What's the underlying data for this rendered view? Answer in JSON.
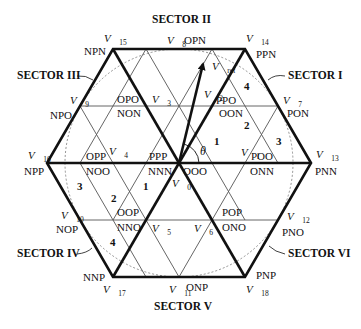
{
  "sectors": {
    "I": "SECTOR I",
    "II": "SECTOR II",
    "III": "SECTOR III",
    "IV": "SECTOR IV",
    "V": "SECTOR V",
    "VI": "SECTOR VI"
  },
  "vectors": {
    "v0": {
      "name": "V",
      "sub": "0"
    },
    "v1": {
      "name": "V",
      "sub": "1"
    },
    "v2": {
      "name": "V",
      "sub": "2"
    },
    "v3": {
      "name": "V",
      "sub": "3"
    },
    "v4": {
      "name": "V",
      "sub": "4"
    },
    "v5": {
      "name": "V",
      "sub": "5"
    },
    "v6": {
      "name": "V",
      "sub": "6"
    },
    "v7": {
      "name": "V",
      "sub": "7"
    },
    "v8": {
      "name": "V",
      "sub": "8"
    },
    "v9": {
      "name": "V",
      "sub": "9"
    },
    "v10": {
      "name": "V",
      "sub": "10"
    },
    "v11": {
      "name": "V",
      "sub": "11"
    },
    "v12": {
      "name": "V",
      "sub": "12"
    },
    "v13": {
      "name": "V",
      "sub": "13"
    },
    "v14": {
      "name": "V",
      "sub": "14"
    },
    "v15": {
      "name": "V",
      "sub": "15"
    },
    "v16": {
      "name": "V",
      "sub": "16"
    },
    "v17": {
      "name": "V",
      "sub": "17"
    },
    "v18": {
      "name": "V",
      "sub": "18"
    },
    "vref": {
      "name": "V",
      "sub": "ref"
    }
  },
  "states": {
    "v0_upper": "PPP",
    "v0_mid": "NNN",
    "v0_lower": "OOO",
    "v1_upper": "POO",
    "v1_lower": "ONN",
    "v2_upper": "PPO",
    "v2_lower": "OON",
    "v3_upper": "OPO",
    "v3_lower": "NON",
    "v4_upper": "OPP",
    "v4_lower": "NOO",
    "v5_upper": "OOP",
    "v5_lower": "NNO",
    "v6_upper": "POP",
    "v6_lower": "ONO",
    "v7": "PON",
    "v8": "OPN",
    "v9": "NPO",
    "v10": "NOP",
    "v11": "ONP",
    "v12": "PNO",
    "v13": "PNN",
    "v14": "PPN",
    "v15": "NPN",
    "v16": "NPP",
    "v17": "NNP",
    "v18": "PNP"
  },
  "regions": {
    "s1_r1": "1",
    "s1_r2": "2",
    "s1_r3": "3",
    "s1_r4": "4",
    "s3_r1": "1",
    "s3_r2": "2",
    "s3_r3": "3",
    "s4_r4": "4"
  },
  "angle_label": "θ",
  "colors": {
    "line": "#111111",
    "grid": "#555555",
    "background": "#ffffff"
  }
}
